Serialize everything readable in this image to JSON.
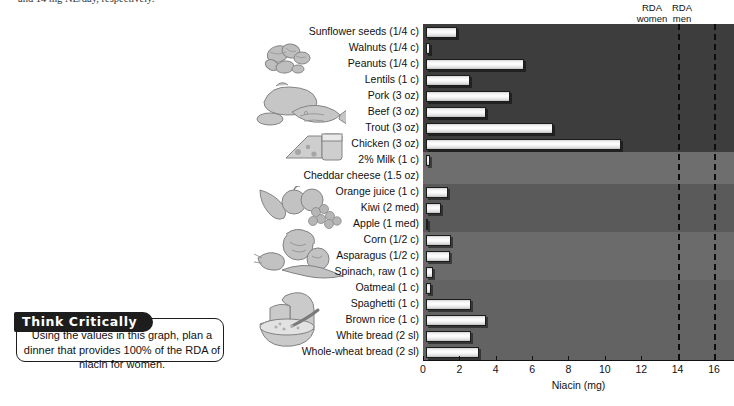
{
  "top_text": "and 14 mg NE/day, respectively.",
  "figure": {
    "rda_women_label_line1": "RDA",
    "rda_women_label_line2": "women",
    "rda_men_label_line1": "RDA",
    "rda_men_label_line2": "men",
    "x_axis_title": "Niacin (mg)"
  },
  "think_critically": {
    "tab_label": "Think Critically",
    "body": "Using the values in this graph, plan a dinner that provides 100% of the RDA of niacin for women."
  },
  "chart_data": {
    "type": "bar",
    "orientation": "horizontal",
    "title": "",
    "xlabel": "Niacin (mg)",
    "ylabel": "",
    "xlim": [
      0,
      17.1
    ],
    "xticks": [
      0,
      2,
      4,
      6,
      8,
      10,
      12,
      14,
      16
    ],
    "grid": false,
    "legend": "none",
    "annotations": [
      {
        "label": "RDA women",
        "value": 14,
        "style": "dashed vertical line"
      },
      {
        "label": "RDA men",
        "value": 16,
        "style": "dashed vertical line"
      }
    ],
    "group_bands": [
      {
        "name": "nuts-seeds-legumes-protein",
        "from": "Sunflower seeds (1/4 c)",
        "to": "Chicken (3 oz)",
        "shade": "#3d3d3d"
      },
      {
        "name": "dairy",
        "from": "2% Milk (1 c)",
        "to": "Cheddar cheese (1.5 oz)",
        "shade": "#6e6e6e"
      },
      {
        "name": "fruit",
        "from": "Orange juice (1 c)",
        "to": "Apple (1 med)",
        "shade": "#5a5a5a"
      },
      {
        "name": "vegetables",
        "from": "Corn (1/2 c)",
        "to": "Spinach, raw (1 c)",
        "shade": "#6b6b6b"
      },
      {
        "name": "grains",
        "from": "Oatmeal (1 c)",
        "to": "Whole-wheat bread (2 sl)",
        "shade": "#636363"
      }
    ],
    "categories": [
      "Sunflower seeds (1/4 c)",
      "Walnuts (1/4 c)",
      "Peanuts (1/4 c)",
      "Lentils (1 c)",
      "Pork (3 oz)",
      "Beef (3 oz)",
      "Trout (3 oz)",
      "Chicken (3 oz)",
      "2% Milk (1 c)",
      "Cheddar cheese (1.5 oz)",
      "Orange juice (1 c)",
      "Kiwi (2 med)",
      "Apple (1 med)",
      "Corn (1/2 c)",
      "Asparagus (1/2 c)",
      "Spinach, raw (1 c)",
      "Oatmeal (1 c)",
      "Spaghetti (1 c)",
      "Brown rice (1 c)",
      "White bread (2 sl)",
      "Whole-wheat bread (2 sl)"
    ],
    "values": [
      1.7,
      0.2,
      5.4,
      2.4,
      4.6,
      3.3,
      7.0,
      10.7,
      0.2,
      0.0,
      1.2,
      0.8,
      0.1,
      1.4,
      1.3,
      0.4,
      0.3,
      2.5,
      3.3,
      2.5,
      2.9
    ],
    "units": "mg"
  }
}
